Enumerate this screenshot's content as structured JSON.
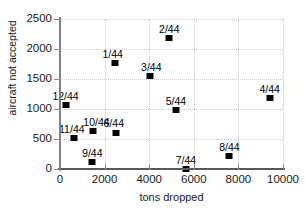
{
  "chart_data": {
    "type": "scatter",
    "title": "",
    "xlabel": "tons dropped",
    "ylabel": "aircraft not accepted",
    "xlim": [
      0,
      10000
    ],
    "ylim": [
      0,
      2500
    ],
    "xticks": [
      0,
      2000,
      4000,
      6000,
      8000,
      10000
    ],
    "xtick_labels": [
      "0",
      "2000",
      "4000",
      "6000",
      "8000",
      "10000"
    ],
    "yticks": [
      0,
      500,
      1000,
      1500,
      2000,
      2500
    ],
    "ytick_labels": [
      "0",
      "500",
      "1000",
      "1500",
      "2000",
      "2500"
    ],
    "grid": "dotted-light",
    "legend": "none",
    "marker": "filled-square-black",
    "points": [
      {
        "label": "12/44",
        "x": 250,
        "y": 1060,
        "label_dx": 0,
        "label_dy": -14
      },
      {
        "label": "11/44",
        "x": 620,
        "y": 520,
        "label_dx": -2,
        "label_dy": -14
      },
      {
        "label": "9/44",
        "x": 1450,
        "y": 120,
        "label_dx": 0,
        "label_dy": -14
      },
      {
        "label": "10/44",
        "x": 1500,
        "y": 630,
        "label_dx": 3,
        "label_dy": -14
      },
      {
        "label": "6/44",
        "x": 2500,
        "y": 600,
        "label_dx": -2,
        "label_dy": -15
      },
      {
        "label": "1/44",
        "x": 2450,
        "y": 1770,
        "label_dx": -2,
        "label_dy": -14
      },
      {
        "label": "3/44",
        "x": 4050,
        "y": 1550,
        "label_dx": 1,
        "label_dy": -14
      },
      {
        "label": "2/44",
        "x": 4900,
        "y": 2190,
        "label_dx": 0,
        "label_dy": -14
      },
      {
        "label": "5/44",
        "x": 5200,
        "y": 980,
        "label_dx": 0,
        "label_dy": -14
      },
      {
        "label": "7/44",
        "x": 5650,
        "y": 0,
        "label_dx": 0,
        "label_dy": -14
      },
      {
        "label": "8/44",
        "x": 7600,
        "y": 210,
        "label_dx": 0,
        "label_dy": -14
      },
      {
        "label": "4/44",
        "x": 9400,
        "y": 1180,
        "label_dx": 0,
        "label_dy": -14
      }
    ]
  },
  "colors": {
    "marker": "#000000",
    "axis": "#595959",
    "grid": "#c9c9c9",
    "text": "#1a1a1a",
    "background": "#ffffff"
  }
}
